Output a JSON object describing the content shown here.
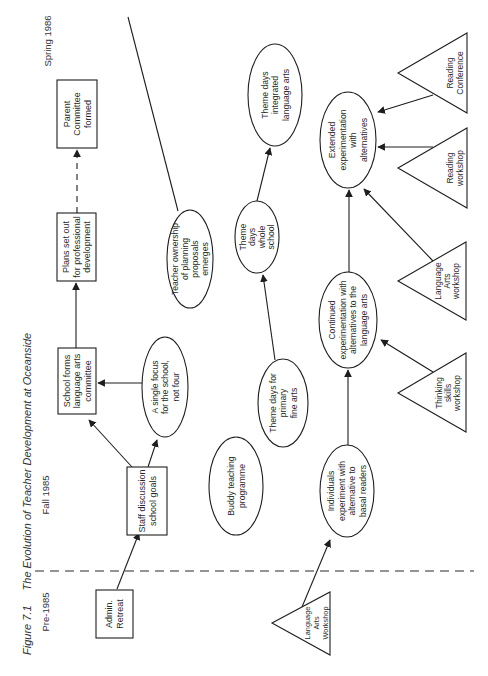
{
  "figure": {
    "number": "Figure 7.1",
    "title": "The Evolution of Teacher Development at Oceanside"
  },
  "periods": [
    {
      "id": "pre-1985",
      "label": "Pre-1985"
    },
    {
      "id": "fall-1985",
      "label": "Fall 1985"
    },
    {
      "id": "spring-1986",
      "label": "Spring 1986"
    }
  ],
  "divider": {
    "style": "dashed",
    "between": [
      "Pre-1985",
      "Fall 1985"
    ]
  },
  "legend_kinds": {
    "box": "event",
    "ellipse": "outcome",
    "triangle": "workshop"
  },
  "nodes": [
    {
      "id": "admin-retreat",
      "kind": "box",
      "lines": [
        "Admin.",
        "Retreat"
      ]
    },
    {
      "id": "staff-discussion",
      "kind": "box",
      "lines": [
        "Staff discussion",
        "school goals"
      ]
    },
    {
      "id": "school-forms-committee",
      "kind": "box",
      "lines": [
        "School forms",
        "language arts",
        "committee"
      ]
    },
    {
      "id": "plans-professional-development",
      "kind": "box",
      "lines": [
        "Plans set out",
        "for professional",
        "development"
      ]
    },
    {
      "id": "parent-committee",
      "kind": "box",
      "lines": [
        "Parent",
        "Committee",
        "formed"
      ]
    },
    {
      "id": "single-focus",
      "kind": "ellipse",
      "lines": [
        "A single focus",
        "for the school,",
        "not four"
      ]
    },
    {
      "id": "teacher-ownership",
      "kind": "ellipse",
      "lines": [
        "Teacher ownership",
        "of planning",
        "proposals",
        "emerges"
      ]
    },
    {
      "id": "buddy-teaching",
      "kind": "ellipse",
      "lines": [
        "Buddy teaching",
        "programme"
      ]
    },
    {
      "id": "theme-days-primary",
      "kind": "ellipse",
      "lines": [
        "Theme days for",
        "primary",
        "fine arts"
      ]
    },
    {
      "id": "theme-days-whole-school",
      "kind": "ellipse",
      "lines": [
        "Theme",
        "days",
        "whole",
        "school"
      ]
    },
    {
      "id": "theme-days-integrated",
      "kind": "ellipse",
      "lines": [
        "Theme days",
        "integrated",
        "language arts"
      ]
    },
    {
      "id": "individuals-experiment",
      "kind": "ellipse",
      "lines": [
        "Individuals",
        "experiment with",
        "alternative to",
        "basal readers"
      ]
    },
    {
      "id": "continued-experimentation",
      "kind": "ellipse",
      "lines": [
        "Continued",
        "experimentation with",
        "alternatives to the",
        "language arts"
      ]
    },
    {
      "id": "extended-experimentation",
      "kind": "ellipse",
      "lines": [
        "Extended",
        "experimentation",
        "with",
        "alternatives"
      ]
    },
    {
      "id": "language-arts-workshop-pre",
      "kind": "triangle",
      "lines": [
        "Language",
        "Arts",
        "Workshop"
      ]
    },
    {
      "id": "thinking-skills-workshop",
      "kind": "triangle",
      "lines": [
        "Thinking",
        "skills",
        "workshop"
      ]
    },
    {
      "id": "language-arts-workshop",
      "kind": "triangle",
      "lines": [
        "Language",
        "Arts",
        "workshop"
      ]
    },
    {
      "id": "reading-workshop",
      "kind": "triangle",
      "lines": [
        "Reading",
        "workshop"
      ]
    },
    {
      "id": "reading-conference",
      "kind": "triangle",
      "lines": [
        "Reading",
        "Conference"
      ]
    }
  ],
  "edges": [
    {
      "from": "admin-retreat",
      "to": "staff-discussion",
      "style": "arrow"
    },
    {
      "from": "staff-discussion",
      "to": "school-forms-committee",
      "style": "arrow"
    },
    {
      "from": "staff-discussion",
      "to": "single-focus",
      "style": "arrow"
    },
    {
      "from": "single-focus",
      "to": "school-forms-committee",
      "style": "arrow"
    },
    {
      "from": "school-forms-committee",
      "to": "plans-professional-development",
      "style": "arrow"
    },
    {
      "from": "plans-professional-development",
      "to": "parent-committee",
      "style": "dashed-arrow"
    },
    {
      "from": "teacher-ownership",
      "to": null,
      "style": "line"
    },
    {
      "from": "language-arts-workshop-pre",
      "to": "individuals-experiment",
      "style": "arrow"
    },
    {
      "from": "individuals-experiment",
      "to": "continued-experimentation",
      "style": "arrow"
    },
    {
      "from": "continued-experimentation",
      "to": "extended-experimentation",
      "style": "arrow"
    },
    {
      "from": "thinking-skills-workshop",
      "to": "continued-experimentation",
      "style": "arrow"
    },
    {
      "from": "language-arts-workshop",
      "to": "extended-experimentation",
      "style": "arrow"
    },
    {
      "from": "reading-workshop",
      "to": "extended-experimentation",
      "style": "arrow"
    },
    {
      "from": "reading-conference",
      "to": "extended-experimentation",
      "style": "arrow"
    },
    {
      "from": "theme-days-primary",
      "to": "theme-days-whole-school",
      "style": "arrow"
    },
    {
      "from": "theme-days-whole-school",
      "to": "theme-days-integrated",
      "style": "arrow"
    }
  ],
  "colors": {
    "ink": "#1e1e1e",
    "background": "#ffffff"
  }
}
